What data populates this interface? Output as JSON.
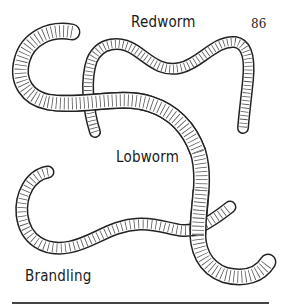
{
  "page": {
    "page_number": "86",
    "labels": {
      "redworm": "Redworm",
      "lobworm": "Lobworm",
      "brandling": "Brandling"
    }
  },
  "illustration": {
    "subject": "worm-species-illustration",
    "worms": [
      "Redworm",
      "Lobworm",
      "Brandling"
    ]
  }
}
